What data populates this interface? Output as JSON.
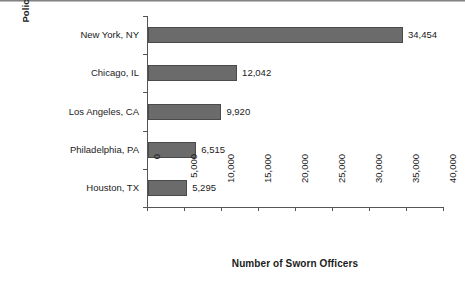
{
  "chart_data": {
    "type": "bar",
    "orientation": "horizontal",
    "title": "",
    "xlabel": "Number of Sworn Officers",
    "ylabel": "Police Department",
    "categories": [
      "New York, NY",
      "Chicago, IL",
      "Los Angeles, CA",
      "Philadelphia, PA",
      "Houston, TX"
    ],
    "values": [
      34454,
      12042,
      9920,
      6515,
      5295
    ],
    "value_labels": [
      "34,454",
      "12,042",
      "9,920",
      "6,515",
      "5,295"
    ],
    "xlim": [
      0,
      40000
    ],
    "xticks": [
      0,
      5000,
      10000,
      15000,
      20000,
      25000,
      30000,
      35000,
      40000
    ],
    "xtick_labels": [
      "0",
      "5,000",
      "10,000",
      "15,000",
      "20,000",
      "25,000",
      "30,000",
      "35,000",
      "40,000"
    ],
    "grid": false,
    "legend": false,
    "bar_color": "#6b6b6b",
    "bar_edge_color": "#4a4a4a",
    "axis_color": "#555555",
    "text_color": "#1b1b1b",
    "background_color": "#ffffff"
  }
}
